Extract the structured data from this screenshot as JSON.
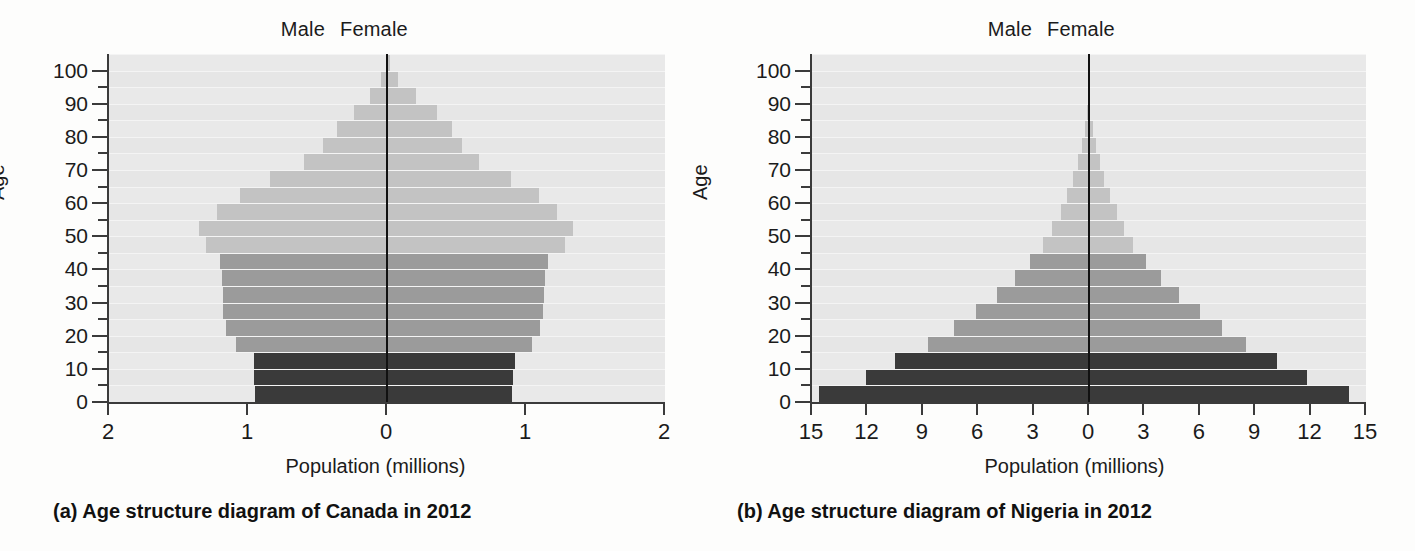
{
  "figure": {
    "panels": [
      {
        "key": "canada",
        "caption": "(a) Age structure diagram of Canada in 2012",
        "male_label": "Male",
        "female_label": "Female",
        "x_axis_title": "Population (millions)",
        "y_axis_title": "Age",
        "x_tick_labels": [
          "2",
          "1",
          "0",
          "1",
          "2"
        ],
        "y_tick_labels": [
          "0",
          "10",
          "20",
          "30",
          "40",
          "50",
          "60",
          "70",
          "80",
          "90",
          "100"
        ]
      },
      {
        "key": "nigeria",
        "caption": "(b) Age structure diagram of Nigeria in 2012",
        "male_label": "Male",
        "female_label": "Female",
        "x_axis_title": "Population (millions)",
        "y_axis_title": "Age",
        "x_tick_labels": [
          "15",
          "12",
          "9",
          "6",
          "3",
          "0",
          "3",
          "6",
          "9",
          "12",
          "15"
        ],
        "y_tick_labels": [
          "0",
          "10",
          "20",
          "30",
          "40",
          "50",
          "60",
          "70",
          "80",
          "90",
          "100"
        ]
      }
    ],
    "colors": {
      "pre_reproductive": "#3a3a3a",
      "reproductive": "#9b9b9b",
      "post_reproductive": "#c3c3c3",
      "plot_background": "#dfdfdf",
      "axis": "#3b3b3b"
    }
  },
  "chart_data": [
    {
      "type": "bar",
      "subtype": "population-pyramid",
      "title": "(a) Age structure diagram of Canada in 2012",
      "xlabel": "Population (millions)",
      "ylabel": "Age",
      "xlim": [
        -2,
        2
      ],
      "xticks": [
        -2,
        -1,
        0,
        1,
        2
      ],
      "xtick_labels": [
        "2",
        "1",
        "0",
        "1",
        "2"
      ],
      "yticks": [
        0,
        10,
        20,
        30,
        40,
        50,
        60,
        70,
        80,
        90,
        100
      ],
      "grid": true,
      "legend": [
        "Male",
        "Female"
      ],
      "legend_position": "top",
      "categories": [
        "0-4",
        "5-9",
        "10-14",
        "15-19",
        "20-24",
        "25-29",
        "30-34",
        "35-39",
        "40-44",
        "45-49",
        "50-54",
        "55-59",
        "60-64",
        "65-69",
        "70-74",
        "75-79",
        "80-84",
        "85-89",
        "90-94",
        "95-99",
        "100+"
      ],
      "cohort_class": [
        "pre",
        "pre",
        "pre",
        "rep",
        "rep",
        "rep",
        "rep",
        "rep",
        "rep",
        "post",
        "post",
        "post",
        "post",
        "post",
        "post",
        "post",
        "post",
        "post",
        "post",
        "post",
        "post"
      ],
      "series": [
        {
          "name": "Male",
          "values": [
            0.95,
            0.96,
            0.96,
            1.09,
            1.16,
            1.18,
            1.18,
            1.19,
            1.2,
            1.3,
            1.35,
            1.22,
            1.06,
            0.84,
            0.6,
            0.46,
            0.36,
            0.24,
            0.12,
            0.04,
            0.01
          ]
        },
        {
          "name": "Female",
          "values": [
            0.9,
            0.91,
            0.92,
            1.04,
            1.1,
            1.12,
            1.13,
            1.14,
            1.16,
            1.28,
            1.34,
            1.22,
            1.09,
            0.89,
            0.66,
            0.54,
            0.47,
            0.36,
            0.21,
            0.08,
            0.02
          ]
        }
      ]
    },
    {
      "type": "bar",
      "subtype": "population-pyramid",
      "title": "(b) Age structure diagram of Nigeria in 2012",
      "xlabel": "Population (millions)",
      "ylabel": "Age",
      "xlim": [
        -15,
        15
      ],
      "xticks": [
        -15,
        -12,
        -9,
        -6,
        -3,
        0,
        3,
        6,
        9,
        12,
        15
      ],
      "xtick_labels": [
        "15",
        "12",
        "9",
        "6",
        "3",
        "0",
        "3",
        "6",
        "9",
        "12",
        "15"
      ],
      "yticks": [
        0,
        10,
        20,
        30,
        40,
        50,
        60,
        70,
        80,
        90,
        100
      ],
      "grid": true,
      "legend": [
        "Male",
        "Female"
      ],
      "legend_position": "top",
      "categories": [
        "0-4",
        "5-9",
        "10-14",
        "15-19",
        "20-24",
        "25-29",
        "30-34",
        "35-39",
        "40-44",
        "45-49",
        "50-54",
        "55-59",
        "60-64",
        "65-69",
        "70-74",
        "75-79",
        "80-84",
        "85-89",
        "90-94",
        "95-99",
        "100+"
      ],
      "cohort_class": [
        "pre",
        "pre",
        "pre",
        "rep",
        "rep",
        "rep",
        "rep",
        "rep",
        "rep",
        "post",
        "post",
        "post",
        "post",
        "post",
        "post",
        "post",
        "post",
        "post",
        "post",
        "post",
        "post"
      ],
      "series": [
        {
          "name": "Male",
          "values": [
            14.6,
            12.1,
            10.5,
            8.7,
            7.3,
            6.1,
            5.0,
            4.0,
            3.2,
            2.5,
            2.0,
            1.5,
            1.2,
            0.85,
            0.6,
            0.38,
            0.2,
            0.09,
            0.04,
            0.01,
            0.0
          ]
        },
        {
          "name": "Female",
          "values": [
            14.1,
            11.8,
            10.2,
            8.5,
            7.2,
            6.0,
            4.9,
            3.9,
            3.1,
            2.4,
            1.9,
            1.5,
            1.15,
            0.82,
            0.58,
            0.36,
            0.19,
            0.08,
            0.03,
            0.01,
            0.0
          ]
        }
      ]
    }
  ]
}
